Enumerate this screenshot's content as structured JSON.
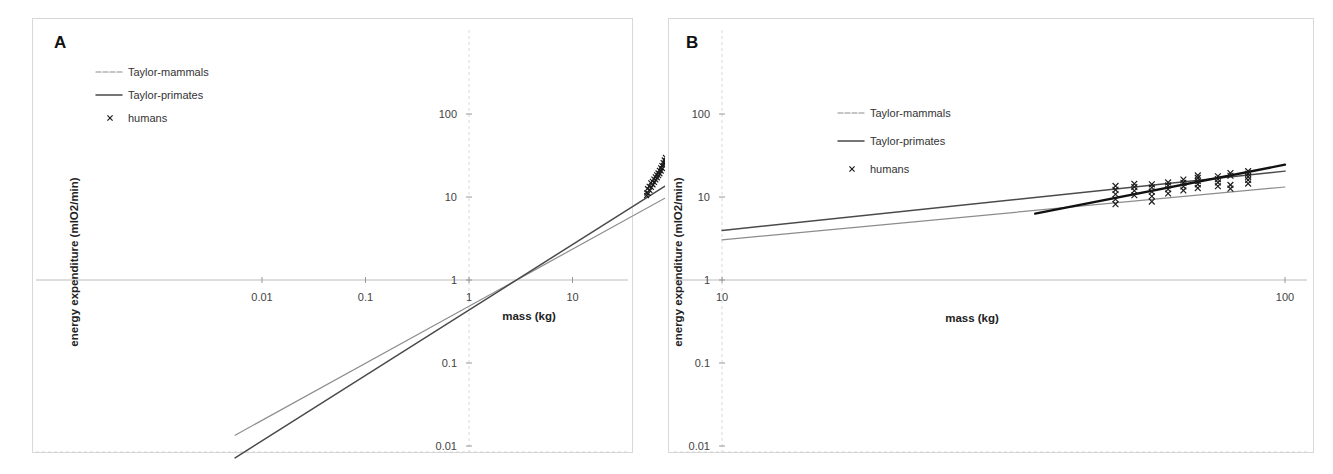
{
  "figure": {
    "background": "#ffffff",
    "panels": [
      "A",
      "B"
    ]
  },
  "colors": {
    "mammals": "#8c8c8c",
    "primates": "#4a4a4a",
    "humans_fit": "#111111",
    "marker": "#1b1b1b",
    "grid": "#cfcfcf",
    "axis": "#b4b4b4",
    "frame": "#d8d8d8"
  },
  "panel_a": {
    "letter": "A",
    "xlabel": "mass (kg)",
    "ylabel": "energy expenditure (mlO2/min)",
    "x_ticks": [
      "0.01",
      "0.1",
      "1",
      "10",
      "100",
      "1000",
      "10000"
    ],
    "y_ticks": [
      "0.01",
      "0.1",
      "1",
      "10",
      "100"
    ],
    "legend": [
      {
        "label": "Taylor-mammals",
        "type": "line",
        "color": "#8c8c8c"
      },
      {
        "label": "Taylor-primates",
        "type": "line",
        "color": "#4a4a4a"
      },
      {
        "label": "humans",
        "type": "marker",
        "symbol": "x",
        "color": "#1b1b1b"
      }
    ]
  },
  "panel_b": {
    "letter": "B",
    "xlabel": "mass (kg)",
    "ylabel": "energy expenditure (mlO2/min)",
    "x_ticks": [
      "10",
      "100"
    ],
    "y_ticks": [
      "0.01",
      "0.1",
      "1",
      "10",
      "100"
    ],
    "legend": [
      {
        "label": "Taylor-mammals",
        "type": "line",
        "color": "#8c8c8c"
      },
      {
        "label": "Taylor-primates",
        "type": "line",
        "color": "#4a4a4a"
      },
      {
        "label": "humans",
        "type": "marker",
        "symbol": "x",
        "color": "#1b1b1b"
      }
    ]
  },
  "chart_data": [
    {
      "id": "panel_a",
      "type": "scatter",
      "title": "A",
      "xlabel": "mass (kg)",
      "ylabel": "energy expenditure (mlO2/min)",
      "xscale": "log",
      "yscale": "log",
      "xlim": [
        0.004,
        20000
      ],
      "ylim": [
        0.006,
        400
      ],
      "xticks": [
        0.01,
        0.1,
        1,
        10,
        100,
        1000,
        10000
      ],
      "yticks": [
        0.01,
        0.1,
        1,
        10,
        100
      ],
      "grid": true,
      "legend_position": "upper-left",
      "series": [
        {
          "name": "Taylor-mammals",
          "type": "line",
          "color": "#8c8c8c",
          "power_law": {
            "coefficient": 0.81,
            "exponent": 0.74
          },
          "x_range": [
            0.0055,
            10000
          ],
          "endpoints": [
            [
              0.0055,
              0.0135
            ],
            [
              10000,
              272
            ]
          ]
        },
        {
          "name": "Taylor-primates",
          "type": "line",
          "color": "#4a4a4a",
          "power_law": {
            "coefficient": 0.78,
            "exponent": 0.82
          },
          "x_range": [
            0.0055,
            10000
          ],
          "endpoints": [
            [
              0.0055,
              0.0072
            ],
            [
              10000,
              620
            ]
          ]
        },
        {
          "name": "humans",
          "type": "scatter",
          "color": "#1b1b1b",
          "symbol": "x",
          "points": [
            [
              52,
              10.4
            ],
            [
              52,
              11.2
            ],
            [
              53,
              12.6
            ],
            [
              54,
              11.0
            ],
            [
              55,
              13.5
            ],
            [
              56,
              12.0
            ],
            [
              57,
              14.8
            ],
            [
              58,
              13.0
            ],
            [
              59,
              15.5
            ],
            [
              60,
              14.0
            ],
            [
              61,
              16.5
            ],
            [
              62,
              15.0
            ],
            [
              63,
              17.5
            ],
            [
              64,
              16.0
            ],
            [
              65,
              18.5
            ],
            [
              66,
              17.0
            ],
            [
              67,
              19.5
            ],
            [
              68,
              18.0
            ],
            [
              69,
              21.0
            ],
            [
              70,
              19.0
            ],
            [
              71,
              22.5
            ],
            [
              72,
              20.5
            ],
            [
              73,
              24.0
            ],
            [
              74,
              22.0
            ],
            [
              75,
              26.0
            ],
            [
              76,
              24.0
            ],
            [
              77,
              28.0
            ],
            [
              78,
              25.5
            ],
            [
              79,
              30.0
            ],
            [
              80,
              27.0
            ]
          ]
        }
      ]
    },
    {
      "id": "panel_b",
      "type": "scatter",
      "title": "B",
      "xlabel": "mass (kg)",
      "ylabel": "energy expenditure (mlO2/min)",
      "xscale": "log",
      "yscale": "log",
      "xlim": [
        10,
        100
      ],
      "ylim": [
        0.006,
        400
      ],
      "xticks": [
        10,
        100
      ],
      "yticks": [
        0.01,
        0.1,
        1,
        10,
        100
      ],
      "grid": true,
      "legend_position": "upper-left",
      "series": [
        {
          "name": "Taylor-mammals",
          "type": "line",
          "color": "#8c8c8c",
          "power_law": {
            "coefficient": 0.81,
            "exponent": 0.74
          },
          "x_range": [
            10,
            100
          ],
          "endpoints": [
            [
              10,
              3.05
            ],
            [
              100,
              13.2
            ]
          ]
        },
        {
          "name": "Taylor-primates",
          "type": "line",
          "color": "#4a4a4a",
          "power_law": {
            "coefficient": 0.78,
            "exponent": 0.82
          },
          "x_range": [
            10,
            100
          ],
          "endpoints": [
            [
              10,
              3.95
            ],
            [
              100,
              20.5
            ]
          ]
        },
        {
          "name": "humans-fit",
          "type": "line",
          "color": "#111111",
          "x_range": [
            36,
            100
          ],
          "endpoints": [
            [
              36,
              6.3
            ],
            [
              100,
              24.5
            ]
          ]
        },
        {
          "name": "humans",
          "type": "scatter",
          "color": "#1b1b1b",
          "symbol": "x",
          "points": [
            [
              50,
              8.2
            ],
            [
              50,
              9.4
            ],
            [
              50,
              10.8
            ],
            [
              50,
              12.2
            ],
            [
              50,
              13.6
            ],
            [
              54,
              10.5
            ],
            [
              54,
              11.9
            ],
            [
              54,
              13.2
            ],
            [
              54,
              14.4
            ],
            [
              58,
              8.8
            ],
            [
              58,
              10.2
            ],
            [
              58,
              11.6
            ],
            [
              58,
              13.0
            ],
            [
              58,
              14.2
            ],
            [
              62,
              11.0
            ],
            [
              62,
              12.4
            ],
            [
              62,
              13.8
            ],
            [
              62,
              15.0
            ],
            [
              66,
              12.0
            ],
            [
              66,
              13.4
            ],
            [
              66,
              14.8
            ],
            [
              66,
              16.2
            ],
            [
              70,
              12.8
            ],
            [
              70,
              14.2
            ],
            [
              70,
              15.6
            ],
            [
              70,
              17.0
            ],
            [
              70,
              18.2
            ],
            [
              76,
              13.5
            ],
            [
              76,
              15.0
            ],
            [
              76,
              16.4
            ],
            [
              76,
              17.8
            ],
            [
              80,
              12.6
            ],
            [
              80,
              14.0
            ],
            [
              80,
              18.0
            ],
            [
              80,
              19.4
            ],
            [
              86,
              14.5
            ],
            [
              86,
              16.0
            ],
            [
              86,
              17.5
            ],
            [
              86,
              19.0
            ],
            [
              86,
              20.5
            ]
          ]
        }
      ]
    }
  ]
}
